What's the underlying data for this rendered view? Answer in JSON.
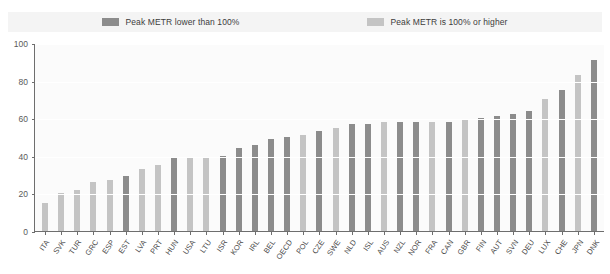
{
  "legend": {
    "items": [
      {
        "label": "Peak METR lower than 100%",
        "color": "#8c8c8c",
        "swatch_name": "legend-swatch-dark"
      },
      {
        "label": "Peak METR is 100% or higher",
        "color": "#c4c4c4",
        "swatch_name": "legend-swatch-light"
      }
    ]
  },
  "axis": {
    "y_ticks": [
      "0",
      "20",
      "40",
      "60",
      "80",
      "100"
    ]
  },
  "chart_data": {
    "type": "bar",
    "title": "",
    "subtitle": "",
    "xlabel": "",
    "ylabel": "",
    "ylim": [
      0,
      100
    ],
    "grid": true,
    "legend_position": "top",
    "categories": [
      "ITA",
      "SVK",
      "TUR",
      "GRC",
      "ESP",
      "EST",
      "LVA",
      "PRT",
      "HUN",
      "USA",
      "LTU",
      "ISR",
      "KOR",
      "IRL",
      "BEL",
      "OECD",
      "POL",
      "CZE",
      "SWE",
      "NLD",
      "ISL",
      "AUS",
      "NZL",
      "NOR",
      "FRA",
      "CAN",
      "GBR",
      "FIN",
      "AUT",
      "SVN",
      "DEU",
      "LUX",
      "CHE",
      "JPN",
      "DNK"
    ],
    "values": [
      15,
      20,
      22,
      26,
      27,
      29,
      33,
      35,
      39,
      39,
      39,
      40,
      44,
      46,
      49,
      50,
      51,
      53,
      55,
      57,
      57,
      58,
      58,
      58,
      58,
      58,
      59,
      60,
      61,
      62,
      64,
      70,
      75,
      83,
      91
    ],
    "bar_colors": [
      "#c4c4c4",
      "#c4c4c4",
      "#c4c4c4",
      "#c4c4c4",
      "#c4c4c4",
      "#8c8c8c",
      "#c4c4c4",
      "#c4c4c4",
      "#8c8c8c",
      "#c4c4c4",
      "#c4c4c4",
      "#8c8c8c",
      "#8c8c8c",
      "#8c8c8c",
      "#8c8c8c",
      "#8c8c8c",
      "#c4c4c4",
      "#8c8c8c",
      "#c4c4c4",
      "#8c8c8c",
      "#8c8c8c",
      "#c4c4c4",
      "#8c8c8c",
      "#8c8c8c",
      "#c4c4c4",
      "#8c8c8c",
      "#c4c4c4",
      "#8c8c8c",
      "#8c8c8c",
      "#8c8c8c",
      "#8c8c8c",
      "#c4c4c4",
      "#8c8c8c",
      "#c4c4c4",
      "#8c8c8c"
    ],
    "series": [
      {
        "name": "Peak METR lower than 100%",
        "color": "#8c8c8c"
      },
      {
        "name": "Peak METR is 100% or higher",
        "color": "#c4c4c4"
      }
    ]
  }
}
